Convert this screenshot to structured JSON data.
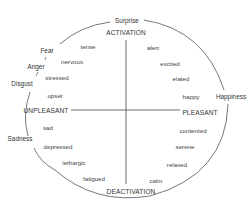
{
  "diagram": {
    "axes": {
      "top": "ACTIVATION",
      "bottom": "DEACTIVATION",
      "left": "UNPLEASANT",
      "right": "PLEASANT"
    },
    "basic_emotions": {
      "surprise": "Surprise",
      "fear": "Fear",
      "anger": "Anger",
      "disgust": "Disgust",
      "sadness": "Sadness",
      "happiness": "Happiness"
    },
    "quadrants": {
      "activated_unpleasant": [
        "tense",
        "nervous",
        "stressed",
        "upset"
      ],
      "activated_pleasant": [
        "alert",
        "excited",
        "elated",
        "happy"
      ],
      "deactivated_unpleasant": [
        "sad",
        "depressed",
        "lethargic",
        "fatigued"
      ],
      "deactivated_pleasant": [
        "contented",
        "serene",
        "relaxed",
        "calm"
      ]
    },
    "colors": {
      "line": "#555555",
      "text": "#333333",
      "background": "#ffffff"
    }
  }
}
